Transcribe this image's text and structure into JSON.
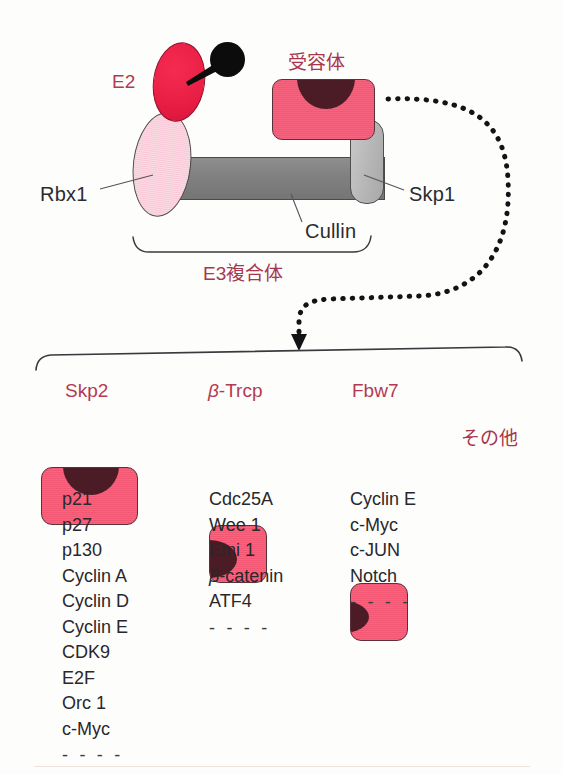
{
  "figure": {
    "complex": {
      "e2_label": "E2",
      "rbx1_label": "Rbx1",
      "cullin_label": "Cullin",
      "skp1_label": "Skp1",
      "receptor_label": "受容体",
      "e3_bracket_label": "E3複合体",
      "ubiquitin_icon": "ubiquitin-ball-icon"
    },
    "arrow": {
      "style": "dotted-curved-arrow",
      "direction": "down"
    },
    "substrate_groups": [
      {
        "name": "Skp2",
        "notch_position": "top",
        "substrates": [
          "p21",
          "p27",
          "p130",
          "Cyclin A",
          "Cyclin D",
          "Cyclin E",
          "CDK9",
          "E2F",
          "Orc 1",
          "c-Myc"
        ],
        "ellipsis": "- - - -"
      },
      {
        "name": "β-Trcp",
        "name_italic_prefix": "β",
        "name_rest": "-Trcp",
        "notch_position": "left",
        "substrates": [
          "Cdc25A",
          "Wee 1",
          "Emi 1",
          "β-catenin",
          "ATF4"
        ],
        "ellipsis": "- - - -"
      },
      {
        "name": "Fbw7",
        "notch_position": "left",
        "substrates": [
          "Cyclin E",
          "c-Myc",
          "c-JUN",
          "Notch"
        ],
        "ellipsis": "- - - -"
      }
    ],
    "others_label": "その他",
    "colors": {
      "pink_label": "#b33a52",
      "jp_label": "#a8364d",
      "e2_red": "#ea1f46",
      "receptor_pink": "#f25873",
      "notch_maroon": "#4b1c26",
      "cullin_gray": "#808080",
      "skp1_gray": "#b6b6b6",
      "rbx1_pink": "#f9cada",
      "text_dark": "#28282c"
    }
  }
}
